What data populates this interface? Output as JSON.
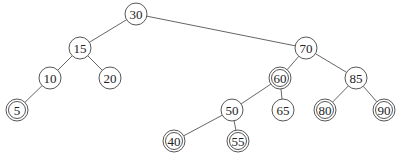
{
  "diagram": {
    "type": "binary-search-tree",
    "radius": 11,
    "nodes": [
      {
        "id": "n30",
        "label": "30",
        "x": 136,
        "y": 14,
        "double": false
      },
      {
        "id": "n15",
        "label": "15",
        "x": 80,
        "y": 48,
        "double": false
      },
      {
        "id": "n70",
        "label": "70",
        "x": 306,
        "y": 48,
        "double": false
      },
      {
        "id": "n10",
        "label": "10",
        "x": 50,
        "y": 78,
        "double": false
      },
      {
        "id": "n20",
        "label": "20",
        "x": 110,
        "y": 78,
        "double": false
      },
      {
        "id": "n60",
        "label": "60",
        "x": 280,
        "y": 78,
        "double": true
      },
      {
        "id": "n85",
        "label": "85",
        "x": 356,
        "y": 78,
        "double": false
      },
      {
        "id": "n5",
        "label": "5",
        "x": 17,
        "y": 110,
        "double": true
      },
      {
        "id": "n50",
        "label": "50",
        "x": 232,
        "y": 110,
        "double": false
      },
      {
        "id": "n65",
        "label": "65",
        "x": 283,
        "y": 110,
        "double": false
      },
      {
        "id": "n80",
        "label": "80",
        "x": 325,
        "y": 110,
        "double": true
      },
      {
        "id": "n90",
        "label": "90",
        "x": 384,
        "y": 110,
        "double": true
      },
      {
        "id": "n40",
        "label": "40",
        "x": 174,
        "y": 141,
        "double": true
      },
      {
        "id": "n55",
        "label": "55",
        "x": 238,
        "y": 141,
        "double": true
      }
    ],
    "edges": [
      [
        "n30",
        "n15"
      ],
      [
        "n30",
        "n70"
      ],
      [
        "n15",
        "n10"
      ],
      [
        "n15",
        "n20"
      ],
      [
        "n10",
        "n5"
      ],
      [
        "n70",
        "n60"
      ],
      [
        "n70",
        "n85"
      ],
      [
        "n60",
        "n50"
      ],
      [
        "n60",
        "n65"
      ],
      [
        "n50",
        "n40"
      ],
      [
        "n50",
        "n55"
      ],
      [
        "n85",
        "n80"
      ],
      [
        "n85",
        "n90"
      ]
    ]
  }
}
